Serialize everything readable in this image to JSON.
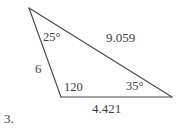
{
  "figure": {
    "problem_number": "3.",
    "background_color": "#fefefe",
    "stroke_color": "#4a4a4a",
    "text_color": "#3d3d3d",
    "vertices": {
      "apex": {
        "x": 29,
        "y": 8
      },
      "bottom_left": {
        "x": 61,
        "y": 97
      },
      "right": {
        "x": 172,
        "y": 97
      }
    },
    "labels": {
      "angle_apex": "25°",
      "side_hypotenuse": "9.059",
      "side_left": "6",
      "angle_bottom_left": "120",
      "angle_right": "35°",
      "side_base": "4.421"
    }
  },
  "chart_data": {
    "type": "diagram",
    "subtype": "triangle",
    "title": "",
    "problem_number": "3.",
    "vertices": [
      {
        "name": "A",
        "role": "apex",
        "x": 29,
        "y": 8
      },
      {
        "name": "B",
        "role": "bottom-left",
        "x": 61,
        "y": 97
      },
      {
        "name": "C",
        "role": "right",
        "x": 172,
        "y": 97
      }
    ],
    "edges": [
      {
        "from": "A",
        "to": "B",
        "label": "6",
        "value": 6,
        "position": "left"
      },
      {
        "from": "A",
        "to": "C",
        "label": "9.059",
        "value": 9.059,
        "position": "upper-right"
      },
      {
        "from": "B",
        "to": "C",
        "label": "4.421",
        "value": 4.421,
        "position": "bottom"
      }
    ],
    "angles": [
      {
        "at": "A",
        "label": "25°",
        "value": 25,
        "units": "degrees",
        "shows_degree_symbol": true
      },
      {
        "at": "B",
        "label": "120",
        "value": 120,
        "units": "degrees",
        "shows_degree_symbol": false
      },
      {
        "at": "C",
        "label": "35°",
        "value": 35,
        "units": "degrees",
        "shows_degree_symbol": true
      }
    ],
    "angle_sum": 180,
    "grid": false,
    "legend": false,
    "axes": false
  }
}
